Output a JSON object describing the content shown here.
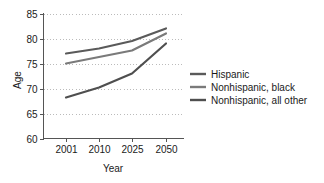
{
  "chart_data": {
    "type": "line",
    "title": "",
    "xlabel": "Year",
    "ylabel": "Age",
    "categories": [
      "2001",
      "2010",
      "2025",
      "2050"
    ],
    "x": [
      2001,
      2010,
      2025,
      2050
    ],
    "ylim": [
      60,
      85
    ],
    "yticks": [
      60,
      65,
      70,
      75,
      80,
      85
    ],
    "ytick_labels": [
      "60",
      "65",
      "70",
      "75",
      "80",
      "85"
    ],
    "xtick_labels": [
      "2001",
      "2010",
      "2025",
      "2050"
    ],
    "grid": "horizontal-dotted",
    "legend_position": "right",
    "series": [
      {
        "name": "Hispanic",
        "color": "#5a5a5a",
        "values": [
          77.0,
          78.0,
          79.5,
          82.0
        ]
      },
      {
        "name": "Nonhispanic, black",
        "color": "#7a7a7a",
        "values": [
          75.0,
          76.3,
          77.6,
          81.0
        ]
      },
      {
        "name": "Nonhispanic, all other",
        "color": "#4f4f4f",
        "values": [
          68.2,
          70.2,
          73.0,
          79.0
        ]
      }
    ]
  },
  "axes": {
    "y_title": "Age",
    "x_title": "Year"
  },
  "legend": {
    "entries": [
      {
        "label": "Hispanic"
      },
      {
        "label": "Nonhispanic, black"
      },
      {
        "label": "Nonhispanic, all other"
      }
    ]
  }
}
